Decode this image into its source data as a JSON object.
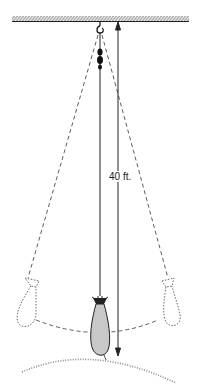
{
  "diagram": {
    "length_label": "40 ft.",
    "elements": {
      "ceiling": "hatched-ceiling",
      "hook": "hook-icon",
      "swivel": "swivel-weight",
      "bob": "sand-bag",
      "ground": "ground-arc",
      "dimension": "length-arrow"
    },
    "colors": {
      "line": "#222222",
      "bag_fill": "#c8c8c8",
      "ground_dots": "#8a8a8a"
    }
  }
}
